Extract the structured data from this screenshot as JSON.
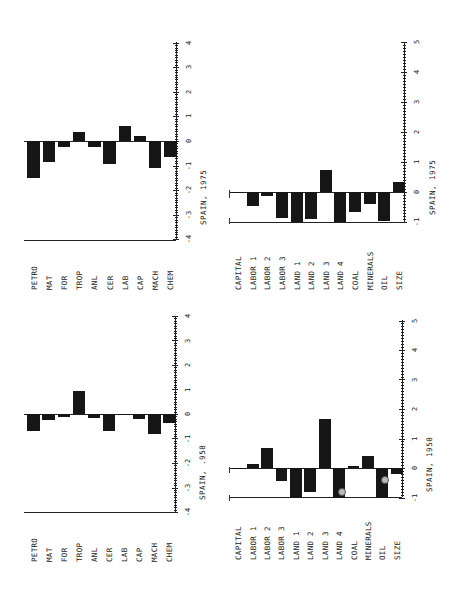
{
  "page": {
    "orientation": "rotated 90 degrees counterclockwise",
    "stray_marks": [
      {
        "x": 229,
        "y": 190,
        "h": 8
      },
      {
        "x": 229,
        "y": 218,
        "h": 6
      },
      {
        "x": 229,
        "y": 467,
        "h": 6
      },
      {
        "x": 229,
        "y": 495,
        "h": 6
      }
    ]
  },
  "chart_data": [
    {
      "id": "spain-1975-products",
      "type": "bar",
      "title": "SPAIN, 1975",
      "categories": [
        "PETRO",
        "MAT",
        "FOR",
        "TROP",
        "ANL",
        "CER",
        "LAB",
        "CAP",
        "MACH",
        "CHEM"
      ],
      "values": [
        -1.5,
        -0.85,
        -0.25,
        0.35,
        -0.25,
        -0.95,
        0.6,
        0.2,
        -1.1,
        -0.65
      ],
      "axis_ticks": [
        "4",
        "3",
        "2",
        "1",
        "0",
        "-1",
        "-2",
        "-3",
        "-4"
      ],
      "ylim": [
        -4,
        4
      ],
      "xlabel": "",
      "ylabel": "",
      "grid": false,
      "legend": null
    },
    {
      "id": "spain-1958-products",
      "type": "bar",
      "title": "SPAIN, .958",
      "categories": [
        "PETRO",
        "MAT",
        "FOR",
        "TROP",
        "ANL",
        "CER",
        "LAB",
        "CAP",
        "MACH",
        "CHEM"
      ],
      "values": [
        -0.7,
        -0.25,
        -0.12,
        0.95,
        -0.18,
        -0.7,
        0.02,
        -0.22,
        -0.8,
        -0.38
      ],
      "axis_ticks": [
        "4",
        "3",
        "2",
        "1",
        "0",
        "-1",
        "-2",
        "-3",
        "-4"
      ],
      "ylim": [
        -4,
        4
      ],
      "xlabel": "",
      "ylabel": "",
      "grid": false,
      "legend": null
    },
    {
      "id": "spain-1975-factors",
      "type": "bar",
      "title": "SPAIN, 1975",
      "categories": [
        "CAPITAL",
        "LABOR 1",
        "LABOR 2",
        "LABOR 3",
        "LAND 1",
        "LAND 2",
        "LAND 3",
        "LAND 4",
        "COAL",
        "MINERALS",
        "OIL",
        "SIZE"
      ],
      "values": [
        0.0,
        -0.45,
        -0.12,
        -0.85,
        -1.0,
        -0.9,
        0.75,
        -1.0,
        -0.65,
        -0.4,
        -0.95,
        0.35
      ],
      "axis_ticks": [
        "5",
        "4",
        "3",
        "2",
        "1",
        "0",
        "-1"
      ],
      "ylim": [
        -1,
        5
      ],
      "xlabel": "",
      "ylabel": "",
      "grid": false,
      "legend": null
    },
    {
      "id": "spain-1958-factors",
      "type": "bar",
      "title": "SPAIN, 1958",
      "categories": [
        "CAPITAL",
        "LABOR 1",
        "LABOR 2",
        "LABOR 3",
        "LAND 1",
        "LAND 2",
        "LAND 3",
        "LAND 4",
        "COAL",
        "MINERALS",
        "OIL",
        "SIZE"
      ],
      "values": [
        0.0,
        0.12,
        0.68,
        -0.45,
        -1.0,
        -0.8,
        1.65,
        -1.0,
        0.06,
        0.4,
        -1.0,
        -0.2
      ],
      "annotations": [
        {
          "category": "LAND 4",
          "type": "circle-marker",
          "value": -0.78
        },
        {
          "category": "OIL",
          "type": "circle-marker",
          "value": -0.37
        }
      ],
      "axis_ticks": [
        "5",
        "4",
        "3",
        "2",
        "1",
        "0",
        "-1"
      ],
      "ylim": [
        -1,
        5
      ],
      "xlabel": "",
      "ylabel": "",
      "grid": false,
      "legend": null
    }
  ],
  "layout": [
    {
      "left": 24,
      "axisX": 176,
      "zeroY": 141,
      "unit": 24.6,
      "topY": 42,
      "botY": 240,
      "barW": 11.5,
      "gap": 15.0,
      "firstBarX": 31,
      "labelY": 290,
      "titleX": 199,
      "titleY": 165
    },
    {
      "left": 24,
      "axisX": 175,
      "zeroY": 414,
      "unit": 24.5,
      "topY": 316,
      "botY": 512,
      "barW": 11.5,
      "gap": 15.0,
      "firstBarX": 29,
      "labelY": 562,
      "titleX": 198,
      "titleY": 440
    },
    {
      "left": 229,
      "axisX": 404,
      "zeroY": 192,
      "unit": 30.0,
      "topY": 42,
      "botY": 222,
      "barW": 12,
      "gap": 14.4,
      "firstBarX": 229,
      "labelY": 290,
      "titleX": 428,
      "titleY": 155
    },
    {
      "left": 229,
      "axisX": 402,
      "zeroY": 468,
      "unit": 29.5,
      "topY": 320,
      "botY": 497,
      "barW": 12,
      "gap": 14.4,
      "firstBarX": 229,
      "labelY": 560,
      "titleX": 425,
      "titleY": 432
    }
  ]
}
